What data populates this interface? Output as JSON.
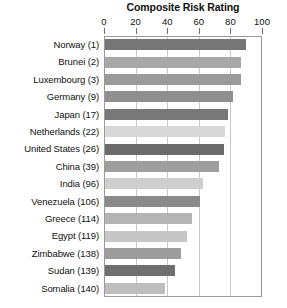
{
  "chart_data": {
    "type": "bar",
    "orientation": "horizontal",
    "title": "Composite Risk Rating",
    "xlabel": "",
    "ylabel": "",
    "xlim": [
      0,
      100
    ],
    "xticks": [
      0,
      20,
      40,
      60,
      80,
      100
    ],
    "grid": true,
    "legend": "none",
    "categories": [
      "Norway (1)",
      "Brunei (2)",
      "Luxembourg (3)",
      "Germany (9)",
      "Japan (17)",
      "Netherlands (22)",
      "United States (26)",
      "China (39)",
      "India (96)",
      "Venezuela (106)",
      "Greece (114)",
      "Egypt (119)",
      "Zimbabwe (138)",
      "Sudan (139)",
      "Somalia (140)"
    ],
    "values": [
      89,
      86,
      86,
      81,
      78,
      76,
      75,
      72,
      62,
      60,
      55,
      52,
      48,
      44,
      38
    ],
    "bar_colors": [
      "#767676",
      "#a8a8a8",
      "#9a9a9a",
      "#8f8f8f",
      "#787878",
      "#d8d8d8",
      "#6b6b6b",
      "#9e9e9e",
      "#cfcfcf",
      "#8a8a8a",
      "#b4b4b4",
      "#c6c6c6",
      "#9c9c9c",
      "#6f6f6f",
      "#bdbdbd"
    ]
  },
  "colors": {
    "axis": "#9a9a9a",
    "gridline": "#c8c8c8",
    "tick": "#6e6e6e",
    "text": "#111111",
    "background": "#ffffff"
  }
}
